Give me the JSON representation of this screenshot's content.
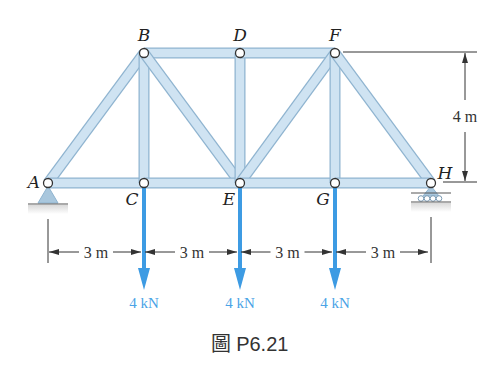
{
  "figure": {
    "caption": "圖 P6.21",
    "colors": {
      "member_fill": "#cfe3f2",
      "member_edge": "#8fb4d0",
      "load_arrow": "#3d9be3",
      "load_text": "#4aa3e6",
      "dimension": "#333333",
      "support": "#a9c7dd"
    },
    "nodes": [
      {
        "id": "A",
        "label": "A",
        "x": 48,
        "y": 183
      },
      {
        "id": "B",
        "label": "B",
        "x": 144,
        "y": 53
      },
      {
        "id": "C",
        "label": "C",
        "x": 144,
        "y": 183
      },
      {
        "id": "D",
        "label": "D",
        "x": 240,
        "y": 53
      },
      {
        "id": "E",
        "label": "E",
        "x": 240,
        "y": 183
      },
      {
        "id": "F",
        "label": "F",
        "x": 335,
        "y": 53
      },
      {
        "id": "G",
        "label": "G",
        "x": 335,
        "y": 183
      },
      {
        "id": "H",
        "label": "H",
        "x": 431,
        "y": 183
      }
    ],
    "members": [
      [
        "A",
        "B"
      ],
      [
        "A",
        "C"
      ],
      [
        "B",
        "C"
      ],
      [
        "B",
        "D"
      ],
      [
        "B",
        "E"
      ],
      [
        "C",
        "E"
      ],
      [
        "D",
        "E"
      ],
      [
        "D",
        "F"
      ],
      [
        "E",
        "F"
      ],
      [
        "E",
        "G"
      ],
      [
        "F",
        "G"
      ],
      [
        "F",
        "H"
      ],
      [
        "G",
        "H"
      ]
    ],
    "supports": {
      "A": "pin",
      "H": "roller"
    },
    "loads": [
      {
        "node": "C",
        "label": "4 kN"
      },
      {
        "node": "E",
        "label": "4 kN"
      },
      {
        "node": "G",
        "label": "4 kN"
      }
    ],
    "dimensions": {
      "horizontal": [
        "3 m",
        "3 m",
        "3 m",
        "3 m"
      ],
      "vertical": "4 m"
    }
  }
}
